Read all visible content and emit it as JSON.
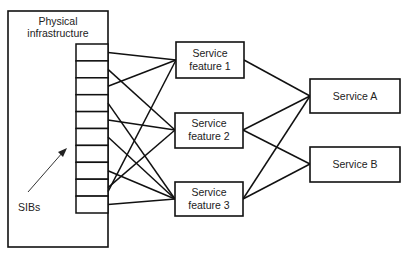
{
  "diagram": {
    "infrastructure": {
      "label_lines": [
        "Physical",
        "infrastructure"
      ]
    },
    "sibs": {
      "label": "SIBs",
      "count": 10
    },
    "service_features": [
      {
        "id": "sf1",
        "label_lines": [
          "Service",
          "feature 1"
        ]
      },
      {
        "id": "sf2",
        "label_lines": [
          "Service",
          "feature 2"
        ]
      },
      {
        "id": "sf3",
        "label_lines": [
          "Service",
          "feature 3"
        ]
      }
    ],
    "services": [
      {
        "id": "svcA",
        "label": "Service A"
      },
      {
        "id": "svcB",
        "label": "Service B"
      }
    ],
    "sib_to_feature_edges": [
      {
        "sib": 1,
        "to": "sf1"
      },
      {
        "sib": 2,
        "to": "sf2"
      },
      {
        "sib": 3,
        "to": "sf1"
      },
      {
        "sib": 4,
        "to": "sf3"
      },
      {
        "sib": 5,
        "to": "sf2"
      },
      {
        "sib": 6,
        "to": "sf3"
      },
      {
        "sib": 8,
        "to": "sf3"
      },
      {
        "sib": 9,
        "to": "sf2"
      },
      {
        "sib": 9,
        "to": "sf1"
      },
      {
        "sib": 10,
        "to": "sf3"
      }
    ],
    "feature_to_service_edges": [
      {
        "from": "sf1",
        "to": "svcA"
      },
      {
        "from": "sf2",
        "to": "svcA"
      },
      {
        "from": "sf2",
        "to": "svcB"
      },
      {
        "from": "sf3",
        "to": "svcA"
      },
      {
        "from": "sf3",
        "to": "svcB"
      }
    ]
  }
}
